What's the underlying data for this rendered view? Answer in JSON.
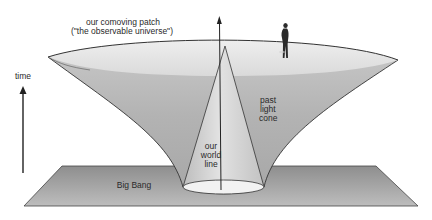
{
  "diagram": {
    "labels": {
      "comoving_patch_line1": "our comoving patch",
      "comoving_patch_line2": "(\"the observable universe\")",
      "time": "time",
      "past_light_cone_line1": "past",
      "past_light_cone_line2": "light",
      "past_light_cone_line3": "cone",
      "world_line_line1": "our",
      "world_line_line2": "world",
      "world_line_line3": "line",
      "big_bang": "Big Bang"
    },
    "colors": {
      "background": "#ffffff",
      "funnel_rim": "#e4e4e4",
      "funnel_inner": "#b8b8b8",
      "cone": "#d0d0d0",
      "plane": "#a9a9a9",
      "outline": "#333333",
      "text": "#2a2a2a"
    }
  }
}
